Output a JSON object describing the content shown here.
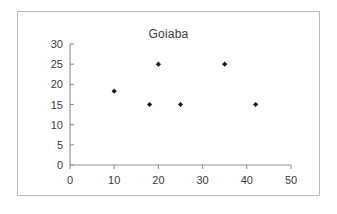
{
  "chart_data": {
    "type": "scatter",
    "title": "Goiaba",
    "xlabel": "",
    "ylabel": "",
    "xlim": [
      0,
      50
    ],
    "ylim": [
      0,
      30
    ],
    "xticks": [
      0,
      10,
      20,
      30,
      40,
      50
    ],
    "yticks": [
      0,
      5,
      10,
      15,
      20,
      25,
      30
    ],
    "xtick_labels": [
      "0",
      "10",
      "20",
      "30",
      "40",
      "50"
    ],
    "ytick_labels": [
      "0",
      "5",
      "10",
      "15",
      "20",
      "25",
      "30"
    ],
    "grid": false,
    "legend": false,
    "marker": "filled-diamond",
    "marker_color": "#1a1a1a",
    "series": [
      {
        "name": "Goiaba",
        "points": [
          {
            "x": 10,
            "y": 18.3
          },
          {
            "x": 18,
            "y": 15
          },
          {
            "x": 20,
            "y": 25
          },
          {
            "x": 25,
            "y": 15
          },
          {
            "x": 35,
            "y": 25
          },
          {
            "x": 42,
            "y": 15
          }
        ]
      }
    ]
  },
  "frame": {
    "border_color": "#b9b9b9",
    "background": "#ffffff"
  }
}
